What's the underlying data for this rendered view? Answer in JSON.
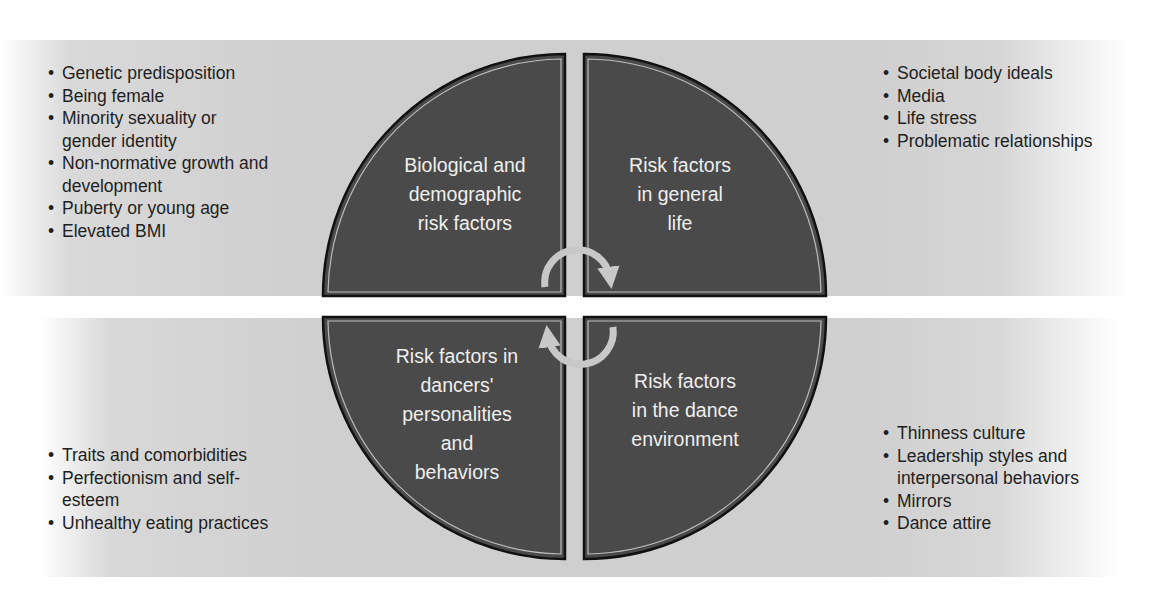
{
  "diagram": {
    "type": "four-quadrant circular risk-factor model",
    "colors": {
      "quadrant_fill": "#4a4a4a",
      "quadrant_stroke": "#111111",
      "inner_stroke": "#bdbdbd",
      "band_gray": "#cfcfcf",
      "arrow": "#c8c8c8",
      "label_text": "#efefef",
      "list_text": "#1e1e1e"
    },
    "quadrants": {
      "top_left": {
        "label": "Biological and\ndemographic\nrisk factors",
        "items": [
          "Genetic predisposition",
          "Being female",
          "Minority sexuality or gender identity",
          "Non-normative growth and development",
          "Puberty or young age",
          "Elevated BMI"
        ]
      },
      "top_right": {
        "label": "Risk factors\nin general\nlife",
        "items": [
          "Societal body ideals",
          "Media",
          "Life stress",
          "Problematic relationships"
        ]
      },
      "bottom_left": {
        "label": "Risk factors in\ndancers'\npersonalities\nand\nbehaviors",
        "items": [
          "Traits and comorbidities",
          "Perfectionism and self-esteem",
          "Unhealthy eating practices"
        ]
      },
      "bottom_right": {
        "label": "Risk factors\nin the dance\nenvironment",
        "items": [
          "Thinness culture",
          "Leadership styles and interpersonal behaviors",
          "Mirrors",
          "Dance attire"
        ]
      }
    },
    "arrows": {
      "top": "clockwise-arrow-icon",
      "bottom": "clockwise-arrow-icon"
    }
  }
}
